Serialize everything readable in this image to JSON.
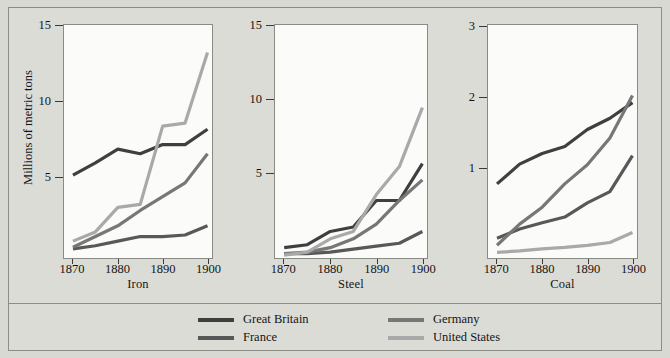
{
  "figure": {
    "ylabel": "Millions of metric tons",
    "background": "#d9d9d4",
    "panel_background": "#fbfbf9",
    "frame_color": "#8d8d87"
  },
  "legend": {
    "position": "bottom",
    "entries": [
      {
        "key": "great_britain",
        "label": "Great Britain",
        "color": "#3f3f3f"
      },
      {
        "key": "france",
        "label": "France",
        "color": "#585858"
      },
      {
        "key": "germany",
        "label": "Germany",
        "color": "#777777"
      },
      {
        "key": "united_states",
        "label": "United States",
        "color": "#a9a9a9"
      }
    ]
  },
  "chart_data": [
    {
      "type": "line",
      "title": "Iron",
      "xlabel": "Iron",
      "ylabel": "Millions of metric tons",
      "x": [
        1870,
        1875,
        1880,
        1885,
        1890,
        1895,
        1900
      ],
      "xlim": [
        1868,
        1901
      ],
      "ylim": [
        0.6,
        15.8
      ],
      "xticks": [
        1870,
        1880,
        1890,
        1900
      ],
      "yticks": [
        5,
        10,
        15
      ],
      "grid": false,
      "series": [
        {
          "name": "Great Britain",
          "color": "#3f3f3f",
          "values": [
            6.0,
            6.8,
            7.7,
            7.4,
            8.0,
            8.0,
            9.0
          ]
        },
        {
          "name": "France",
          "color": "#585858",
          "values": [
            1.2,
            1.4,
            1.7,
            2.0,
            2.0,
            2.1,
            2.7
          ]
        },
        {
          "name": "Germany",
          "color": "#777777",
          "values": [
            1.3,
            2.0,
            2.7,
            3.7,
            4.6,
            5.5,
            7.4
          ]
        },
        {
          "name": "United States",
          "color": "#a9a9a9",
          "values": [
            1.7,
            2.3,
            3.9,
            4.1,
            9.2,
            9.4,
            14.0
          ]
        }
      ]
    },
    {
      "type": "line",
      "title": "Steel",
      "xlabel": "Steel",
      "ylabel": "Millions of metric tons",
      "x": [
        1870,
        1875,
        1880,
        1885,
        1890,
        1895,
        1900
      ],
      "xlim": [
        1868,
        1901
      ],
      "ylim": [
        0.0,
        15.8
      ],
      "xticks": [
        1870,
        1880,
        1890,
        1900
      ],
      "yticks": [
        5,
        10,
        15
      ],
      "grid": false,
      "series": [
        {
          "name": "Great Britain",
          "color": "#3f3f3f",
          "values": [
            0.7,
            0.9,
            1.8,
            2.1,
            3.9,
            3.9,
            6.4
          ]
        },
        {
          "name": "France",
          "color": "#585858",
          "values": [
            0.3,
            0.3,
            0.4,
            0.6,
            0.8,
            1.0,
            1.8
          ]
        },
        {
          "name": "Germany",
          "color": "#777777",
          "values": [
            0.3,
            0.4,
            0.7,
            1.3,
            2.3,
            3.9,
            5.3
          ]
        },
        {
          "name": "United States",
          "color": "#a9a9a9",
          "values": [
            0.2,
            0.4,
            1.3,
            1.8,
            4.3,
            6.2,
            10.2
          ]
        }
      ]
    },
    {
      "type": "line",
      "title": "Coal",
      "xlabel": "Coal",
      "ylabel": "Millions of metric tons",
      "x": [
        1870,
        1875,
        1880,
        1885,
        1890,
        1895,
        1900
      ],
      "xlim": [
        1868,
        1901
      ],
      "ylim": [
        0.0,
        3.3
      ],
      "xticks": [
        1870,
        1880,
        1890,
        1900
      ],
      "yticks": [
        1,
        2,
        3
      ],
      "grid": false,
      "series": [
        {
          "name": "Great Britain",
          "color": "#3f3f3f",
          "values": [
            1.05,
            1.33,
            1.48,
            1.58,
            1.82,
            1.98,
            2.2
          ]
        },
        {
          "name": "France",
          "color": "#585858",
          "values": [
            0.28,
            0.41,
            0.5,
            0.58,
            0.78,
            0.94,
            1.45
          ]
        },
        {
          "name": "Germany",
          "color": "#777777",
          "values": [
            0.18,
            0.48,
            0.72,
            1.05,
            1.32,
            1.7,
            2.3
          ]
        },
        {
          "name": "United States",
          "color": "#a9a9a9",
          "values": [
            0.08,
            0.1,
            0.13,
            0.15,
            0.18,
            0.22,
            0.36
          ]
        }
      ]
    }
  ]
}
